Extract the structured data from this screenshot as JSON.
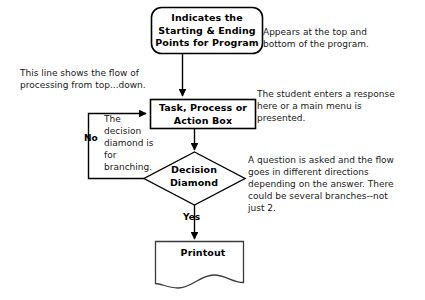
{
  "diagram": {
    "background_color": "#ffffff",
    "stroke_color": "#000000",
    "text_color": "#000000",
    "nodes": [
      {
        "id": "terminator",
        "shape": "rounded-rectangle",
        "label": "Indicates the\nStarting & Ending\nPoints for Program"
      },
      {
        "id": "process",
        "shape": "rectangle",
        "label": "Task, Process or\nAction Box"
      },
      {
        "id": "decision",
        "shape": "diamond",
        "label": "Decision\nDiamond"
      },
      {
        "id": "printout",
        "shape": "document",
        "label": "Printout"
      }
    ],
    "edge_labels": {
      "no": "No",
      "yes": "Yes"
    },
    "annotations": {
      "terminator": "Appears at the top and\nbottom of the program.",
      "flow_line": "This line shows the flow of\nprocessing from top...down.",
      "process": "The student enters a response\nhere or a main menu is\npresented.",
      "decision_left": "The\ndecision\ndiamond is\nfor\nbranching.",
      "decision_right": "A question is asked and the flow\ngoes in different directions\ndepending on the answer.  There\ncould be several branches--not\njust 2."
    }
  }
}
